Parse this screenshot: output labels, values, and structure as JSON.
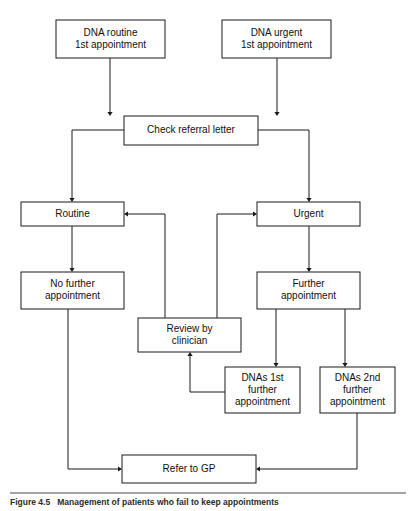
{
  "figure": {
    "type": "flowchart",
    "orientation": "top-to-bottom",
    "background_color": "#ffffff",
    "line_color": "#1a1a1a",
    "text_color": "#111111",
    "caption_label": "Figure 4.5",
    "caption_text": "Management of patients who fail to keep appointments"
  },
  "nodes": {
    "dna_routine": {
      "id": "dna_routine",
      "line1": "DNA routine",
      "line2": "1st appointment",
      "x": 56,
      "y": 20,
      "w": 109,
      "h": 38
    },
    "dna_urgent": {
      "id": "dna_urgent",
      "line1": "DNA urgent",
      "line2": "1st appointment",
      "x": 222,
      "y": 20,
      "w": 109,
      "h": 38
    },
    "check_referral": {
      "id": "check_referral",
      "line1": "Check referral letter",
      "line2": "",
      "x": 124,
      "y": 116,
      "w": 134,
      "h": 29
    },
    "routine": {
      "id": "routine",
      "line1": "Routine",
      "line2": "",
      "x": 21,
      "y": 202,
      "w": 103,
      "h": 24
    },
    "urgent": {
      "id": "urgent",
      "line1": "Urgent",
      "line2": "",
      "x": 257,
      "y": 202,
      "w": 103,
      "h": 24
    },
    "no_further": {
      "id": "no_further",
      "line1": "No further",
      "line2": "appointment",
      "x": 21,
      "y": 272,
      "w": 103,
      "h": 37
    },
    "further": {
      "id": "further",
      "line1": "Further",
      "line2": "appointment",
      "x": 257,
      "y": 272,
      "w": 103,
      "h": 37
    },
    "review_clinician": {
      "id": "review_clinician",
      "line1": "Review by",
      "line2": "clinician",
      "x": 138,
      "y": 318,
      "w": 103,
      "h": 34
    },
    "dnas_1st": {
      "id": "dnas_1st",
      "line1": "DNAs 1st",
      "line2": "further",
      "line3": "appointment",
      "x": 225,
      "y": 367,
      "w": 75,
      "h": 46
    },
    "dnas_2nd": {
      "id": "dnas_2nd",
      "line1": "DNAs 2nd",
      "line2": "further",
      "line3": "appointment",
      "x": 320,
      "y": 367,
      "w": 75,
      "h": 46
    },
    "refer_gp": {
      "id": "refer_gp",
      "line1": "Refer to GP",
      "line2": "",
      "x": 122,
      "y": 455,
      "w": 134,
      "h": 28
    }
  },
  "edges": [
    {
      "id": "e1",
      "from": "dna_routine",
      "to": "check_referral",
      "points": "110,58 110,114",
      "arrow": "down",
      "ax": 110,
      "ay": 116
    },
    {
      "id": "e2",
      "from": "dna_urgent",
      "to": "check_referral",
      "points": "277,58 277,114",
      "arrow": "down",
      "ax": 277,
      "ay": 116
    },
    {
      "id": "e3",
      "from": "check_referral",
      "to": "routine",
      "points": "124,130 72,130 72,200",
      "arrow": "down",
      "ax": 72,
      "ay": 202
    },
    {
      "id": "e4",
      "from": "check_referral",
      "to": "urgent",
      "points": "258,130 309,130 309,200",
      "arrow": "down",
      "ax": 309,
      "ay": 202
    },
    {
      "id": "e5",
      "from": "routine",
      "to": "no_further",
      "points": "72,226 72,270",
      "arrow": "down",
      "ax": 72,
      "ay": 272
    },
    {
      "id": "e6",
      "from": "urgent",
      "to": "further",
      "points": "309,226 309,270",
      "arrow": "down",
      "ax": 309,
      "ay": 272
    },
    {
      "id": "e7",
      "from": "review_clinician",
      "to": "routine",
      "points": "165,318 165,214 126,214",
      "arrow": "left",
      "ax": 124,
      "ay": 214
    },
    {
      "id": "e8",
      "from": "review_clinician",
      "to": "urgent",
      "points": "217,318 217,214 255,214",
      "arrow": "right",
      "ax": 257,
      "ay": 214
    },
    {
      "id": "e9",
      "from": "further",
      "to": "dnas_1st",
      "points": "276,309 276,365",
      "arrow": "down",
      "ax": 276,
      "ay": 367
    },
    {
      "id": "e10",
      "from": "further",
      "to": "dnas_2nd",
      "points": "345,309 345,365",
      "arrow": "down",
      "ax": 345,
      "ay": 367
    },
    {
      "id": "e11",
      "from": "dnas_1st",
      "to": "review_clinician",
      "points": "225,392 190,392 190,356",
      "arrow": "up",
      "ax": 190,
      "ay": 352
    },
    {
      "id": "e12",
      "from": "no_further",
      "to": "refer_gp",
      "points": "68,309 68,469 120,469",
      "arrow": "right",
      "ax": 122,
      "ay": 469
    },
    {
      "id": "e13",
      "from": "dnas_2nd",
      "to": "refer_gp",
      "points": "357,413 357,469 258,469",
      "arrow": "left",
      "ax": 256,
      "ay": 469
    }
  ]
}
